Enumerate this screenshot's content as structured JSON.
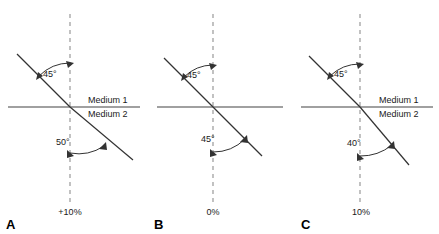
{
  "figure": {
    "panels": [
      {
        "id": "A",
        "letter": "A",
        "incident_angle": "45°",
        "refracted_angle": "50°",
        "percent_label": "+10%",
        "medium_upper": "Medium 1",
        "medium_lower": "Medium 2",
        "show_medium_labels": true,
        "bend": "away-from-normal"
      },
      {
        "id": "B",
        "letter": "B",
        "incident_angle": "45°",
        "refracted_angle": "45°",
        "percent_label": "0%",
        "medium_upper": "",
        "medium_lower": "",
        "show_medium_labels": false,
        "bend": "none"
      },
      {
        "id": "C",
        "letter": "C",
        "incident_angle": "45°",
        "refracted_angle": "40°",
        "percent_label": "10%",
        "medium_upper": "Medium 1",
        "medium_lower": "Medium 2",
        "show_medium_labels": true,
        "bend": "toward-normal"
      }
    ]
  },
  "colors": {
    "background": "#ffffff",
    "ray": "#333333",
    "interface_line": "#808080",
    "normal_dashed": "#999999",
    "text": "#1a1a1a",
    "letter": "#000000"
  }
}
